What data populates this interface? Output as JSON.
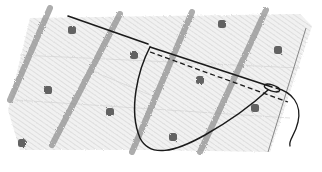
{
  "illustration": {
    "subject": "sewing-stitch-sketch",
    "alt_text": "Pencil sketch of a needle and thread stitching through dotted striped fabric",
    "colors": {
      "background": "#ffffff",
      "fabric_shade": "#d9d9d9",
      "fabric_hatch": "#c4c4c4",
      "stripe": "#8a8a8a",
      "dot": "#4a4a4a",
      "thread": "#1a1a1a",
      "edge": "#7a7a7a"
    },
    "stripes": [
      {
        "x1": 50,
        "y1": 8,
        "x2": 10,
        "y2": 100
      },
      {
        "x1": 120,
        "y1": 14,
        "x2": 52,
        "y2": 145
      },
      {
        "x1": 192,
        "y1": 12,
        "x2": 132,
        "y2": 152
      },
      {
        "x1": 266,
        "y1": 10,
        "x2": 200,
        "y2": 152
      }
    ],
    "dots": [
      {
        "x": 72,
        "y": 30
      },
      {
        "x": 134,
        "y": 55
      },
      {
        "x": 222,
        "y": 24
      },
      {
        "x": 278,
        "y": 50
      },
      {
        "x": 48,
        "y": 90
      },
      {
        "x": 110,
        "y": 112
      },
      {
        "x": 200,
        "y": 80
      },
      {
        "x": 22,
        "y": 143
      },
      {
        "x": 173,
        "y": 137
      },
      {
        "x": 255,
        "y": 108
      }
    ]
  }
}
